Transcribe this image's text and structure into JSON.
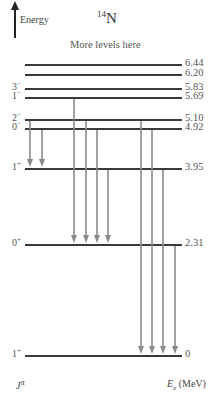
{
  "header": {
    "energy_axis_label": "Energy",
    "nucleus_mass": "14",
    "nucleus_symbol": "N",
    "note": "More levels here"
  },
  "footer": {
    "spin_parity_label": "J",
    "spin_parity_sup": "π",
    "energy_label_E": "E",
    "energy_label_sub": "x",
    "energy_label_unit": "(MeV)"
  },
  "levels": [
    {
      "jp": "",
      "jp_sign": "",
      "energy": "6.44",
      "y": 65
    },
    {
      "jp": "",
      "jp_sign": "",
      "energy": "6.20",
      "y": 75
    },
    {
      "jp": "3",
      "jp_sign": "−",
      "energy": "5.83",
      "y": 89
    },
    {
      "jp": "1",
      "jp_sign": "−",
      "energy": "5.69",
      "y": 98
    },
    {
      "jp": "2",
      "jp_sign": "−",
      "energy": "5.10",
      "y": 120
    },
    {
      "jp": "0",
      "jp_sign": "−",
      "energy": "4.92",
      "y": 129
    },
    {
      "jp": "1",
      "jp_sign": "+",
      "energy": "3.95",
      "y": 169
    },
    {
      "jp": "0",
      "jp_sign": "+",
      "energy": "2.31",
      "y": 245
    },
    {
      "jp": "1",
      "jp_sign": "+",
      "energy": "0",
      "y": 356
    }
  ],
  "transitions": [
    {
      "from": "5.10",
      "to": "3.95",
      "x": 30
    },
    {
      "from": "4.92",
      "to": "3.95",
      "x": 42
    },
    {
      "from": "5.69",
      "to": "2.31",
      "x": 74
    },
    {
      "from": "5.10",
      "to": "2.31",
      "x": 86
    },
    {
      "from": "4.92",
      "to": "2.31",
      "x": 97
    },
    {
      "from": "3.95",
      "to": "2.31",
      "x": 108
    },
    {
      "from": "5.10",
      "to": "0",
      "x": 141
    },
    {
      "from": "4.92",
      "to": "0",
      "x": 152
    },
    {
      "from": "3.95",
      "to": "0",
      "x": 163
    },
    {
      "from": "2.31",
      "to": "0",
      "x": 175
    }
  ],
  "colors": {
    "level_line": "#3a3a3a",
    "transition_arrow": "#8a8a8a",
    "text": "#444444"
  }
}
